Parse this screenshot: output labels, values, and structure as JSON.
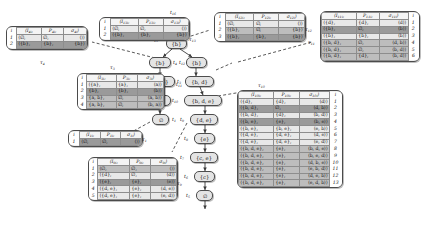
{
  "figure": {
    "tree_label": "T",
    "root_node": "0"
  },
  "nodes": [
    {
      "id": "t16",
      "label": "∅",
      "tag": "t16",
      "root": true
    },
    {
      "id": "t15",
      "label": "{b}",
      "tag": "t15",
      "root": false
    },
    {
      "id": "t14",
      "label": "{b}",
      "tag": "t14",
      "root": false
    },
    {
      "id": "t13",
      "label": "{a, b}",
      "tag": "t13",
      "root": false
    },
    {
      "id": "t12",
      "label": "{a}",
      "tag": "t12",
      "root": false
    },
    {
      "id": "t11",
      "label": "∅",
      "tag": "t11",
      "root": false
    },
    {
      "id": "t21",
      "label": "{b}",
      "tag": "t12b",
      "root": false
    },
    {
      "id": "t22",
      "label": "{b, d}",
      "tag": "t11b",
      "root": false
    },
    {
      "id": "t23",
      "label": "{b, d, e}",
      "tag": "t10",
      "root": false
    },
    {
      "id": "t24",
      "label": "{d, e}",
      "tag": "t9",
      "root": false
    },
    {
      "id": "t25",
      "label": "{e}",
      "tag": "t8",
      "root": false
    },
    {
      "id": "t26",
      "label": "{c, e}",
      "tag": "t7",
      "root": false
    },
    {
      "id": "t27",
      "label": "{c}",
      "tag": "t6",
      "root": false
    },
    {
      "id": "t28",
      "label": "∅",
      "tag": "t5",
      "root": false
    }
  ],
  "node_tags": {
    "t16": "t16",
    "t15": "t15",
    "t14": "t4",
    "t13": "t3",
    "t12": "t2",
    "t11": "t1",
    "t21": "t12",
    "t22": "t11",
    "t23": "t10",
    "t24": "t9",
    "t25": "t8",
    "t26": "t7",
    "t27": "t6",
    "t28": "t5"
  },
  "tables": [
    {
      "key": "T4",
      "caption": "τ4",
      "caption_pos": "bottom",
      "headers": [
        "i",
        "I4,i,",
        "P4,i,",
        "σ4,i"
      ],
      "rows": [
        {
          "idx": "1",
          "I": "⟨∅,",
          "P": "∅,",
          "S": "⟨⟩⟩",
          "shade": "light"
        },
        {
          "idx": "2",
          "I": "⟨{b},",
          "P": "{b},",
          "S": "{b}⟩",
          "shade": "dark"
        }
      ]
    },
    {
      "key": "T13",
      "caption": "τ13",
      "caption_pos": "right",
      "headers": [
        "i",
        "I13,i,",
        "P13,i,",
        "σ13,i"
      ],
      "rows": [
        {
          "idx": "1",
          "I": "⟨∅,",
          "P": "∅,",
          "S": "⟨⟩⟩",
          "shade": "light"
        },
        {
          "idx": "2",
          "I": "⟨{b},",
          "P": "{b},",
          "S": "{b}⟩",
          "shade": "dark"
        }
      ]
    },
    {
      "key": "T3",
      "caption": "τ3",
      "caption_pos": "top",
      "headers": [
        "i",
        "I3,i,",
        "P3,i,",
        "σ3,i"
      ],
      "rows": [
        {
          "idx": "1",
          "I": "⟨{a},",
          "P": "{a},",
          "S": "⟨a⟩⟩",
          "shade": "light"
        },
        {
          "idx": "2",
          "I": "{b},",
          "P": "{b},",
          "S": "⟨b⟩⟩",
          "shade": "dark"
        },
        {
          "idx": "3",
          "I": "{a, b},",
          "P": "∅,",
          "S": "⟨a, b⟩⟩",
          "shade": "mid"
        },
        {
          "idx": "4",
          "I": "{a, b},",
          "P": "∅,",
          "S": "⟨b, a⟩⟩",
          "shade": "mid"
        }
      ]
    },
    {
      "key": "T1",
      "caption": "τ1",
      "caption_pos": "right",
      "headers": [
        "i",
        "I1,i,",
        "P1,i,",
        "σ1,i"
      ],
      "rows": [
        {
          "idx": "1",
          "I": "⟨∅,",
          "P": "∅,",
          "S": "⟨⟩⟩",
          "shade": "dark"
        }
      ]
    },
    {
      "key": "T9",
      "caption": "τ9",
      "caption_pos": "right",
      "headers": [
        "i",
        "I9,i,",
        "P9,i,",
        "σ9,i"
      ],
      "rows": [
        {
          "idx": "1",
          "I": "⟨∅,",
          "P": "∅,",
          "S": "⟨⟩⟩",
          "shade": "mid"
        },
        {
          "idx": "2",
          "I": "⟨{d},",
          "P": "∅,",
          "S": "⟨d⟩⟩",
          "shade": "light"
        },
        {
          "idx": "3",
          "I": "⟨{e},",
          "P": "{e},",
          "S": "⟨e⟩⟩",
          "shade": "dark"
        },
        {
          "idx": "4",
          "I": "⟨{d, e},",
          "P": "{e},",
          "S": "⟨d, e⟩⟩",
          "shade": "light"
        },
        {
          "idx": "5",
          "I": "⟨{d, e},",
          "P": "{e},",
          "S": "⟨e, d⟩⟩",
          "shade": "light"
        }
      ]
    },
    {
      "key": "T12",
      "caption": "τ12",
      "caption_pos": "right",
      "headers": [
        "i",
        "I12,i,",
        "P12,i,",
        "σ12,i"
      ],
      "rows": [
        {
          "idx": "1",
          "I": "⟨∅,",
          "P": "∅,",
          "S": "⟨⟩⟩",
          "shade": "light"
        },
        {
          "idx": "2",
          "I": "⟨{b},",
          "P": "∅,",
          "S": "{b}⟩",
          "shade": "mid"
        },
        {
          "idx": "3",
          "I": "⟨{b},",
          "P": "{b},",
          "S": "{b}⟩",
          "shade": "dark"
        }
      ]
    },
    {
      "key": "T11",
      "caption": "τ11",
      "caption_pos": "left",
      "headers": [
        "I11,i,",
        "P11,i,",
        "σ11,i",
        "i"
      ],
      "rows": [
        {
          "idx": "1",
          "I": "⟨{d},",
          "P": "{d},",
          "S": "⟨d⟩⟩",
          "shade": "light"
        },
        {
          "idx": "2",
          "I": "⟨{b},",
          "P": "∅,",
          "S": "⟨b⟩⟩",
          "shade": "dark"
        },
        {
          "idx": "3",
          "I": "⟨{b},",
          "P": "{b},",
          "S": "⟨b⟩⟩",
          "shade": "light"
        },
        {
          "idx": "4",
          "I": "⟨{b, d},",
          "P": "∅,",
          "S": "⟨d, b⟩⟩",
          "shade": "mid"
        },
        {
          "idx": "5",
          "I": "⟨{b, d},",
          "P": "∅,",
          "S": "⟨b, d⟩⟩",
          "shade": "mid"
        },
        {
          "idx": "6",
          "I": "⟨{b, d},",
          "P": "{d},",
          "S": "⟨b, d⟩⟩",
          "shade": "mid"
        }
      ]
    },
    {
      "key": "T10",
      "caption": "τ10",
      "caption_pos": "top",
      "headers": [
        "I10,i,",
        "P10,i,",
        "σ10,i",
        "i"
      ],
      "rows": [
        {
          "idx": "1",
          "I": "⟨{d},",
          "P": "{d},",
          "S": "⟨d⟩⟩",
          "shade": "light"
        },
        {
          "idx": "2",
          "I": "⟨{b, d},",
          "P": "∅,",
          "S": "⟨d, b⟩⟩",
          "shade": "dark"
        },
        {
          "idx": "3",
          "I": "⟨{b, d},",
          "P": "{d},",
          "S": "⟨b, d⟩⟩",
          "shade": "light"
        },
        {
          "idx": "4",
          "I": "⟨{b, e},",
          "P": "{e},",
          "S": "⟨b, e⟩⟩",
          "shade": "dark"
        },
        {
          "idx": "5",
          "I": "⟨{b, e},",
          "P": "{b, e},",
          "S": "⟨e, b⟩⟩",
          "shade": "light"
        },
        {
          "idx": "6",
          "I": "⟨{d, e},",
          "P": "{d, e},",
          "S": "⟨d, e⟩⟩",
          "shade": "light"
        },
        {
          "idx": "7",
          "I": "⟨{d, e},",
          "P": "{d, e},",
          "S": "⟨e, d⟩⟩",
          "shade": "light"
        },
        {
          "idx": "8",
          "I": "⟨{b, d, e},",
          "P": "{e},",
          "S": "⟨b, d, e⟩⟩",
          "shade": "mid"
        },
        {
          "idx": "9",
          "I": "⟨{b, d, e},",
          "P": "{e},",
          "S": "⟨b, e, d⟩⟩",
          "shade": "mid"
        },
        {
          "idx": "10",
          "I": "⟨{b, d, e},",
          "P": "{e},",
          "S": "⟨d, b, e⟩⟩",
          "shade": "mid"
        },
        {
          "idx": "11",
          "I": "⟨{b, d, e},",
          "P": "{e},",
          "S": "⟨e, b, d⟩⟩",
          "shade": "mid"
        },
        {
          "idx": "12",
          "I": "⟨{b, d, e},",
          "P": "{e},",
          "S": "⟨d, e, b⟩⟩",
          "shade": "mid"
        },
        {
          "idx": "13",
          "I": "⟨{b, d, e},",
          "P": "{e},",
          "S": "⟨e, d, b⟩⟩",
          "shade": "mid"
        }
      ]
    }
  ],
  "edge_labels": [
    {
      "id": "t16",
      "text": "t16"
    },
    {
      "id": "t15",
      "text": "t15"
    },
    {
      "id": "t4",
      "text": "t4"
    },
    {
      "id": "t3",
      "text": "t3"
    },
    {
      "id": "t2",
      "text": "t2"
    },
    {
      "id": "t1",
      "text": "t1"
    },
    {
      "id": "t12",
      "text": "t12"
    },
    {
      "id": "t11",
      "text": "t11"
    },
    {
      "id": "t10",
      "text": "t10"
    },
    {
      "id": "t9",
      "text": "t9"
    },
    {
      "id": "t8",
      "text": "t8"
    },
    {
      "id": "t7",
      "text": "t7"
    },
    {
      "id": "t6",
      "text": "t6"
    },
    {
      "id": "t5",
      "text": "t5"
    }
  ]
}
